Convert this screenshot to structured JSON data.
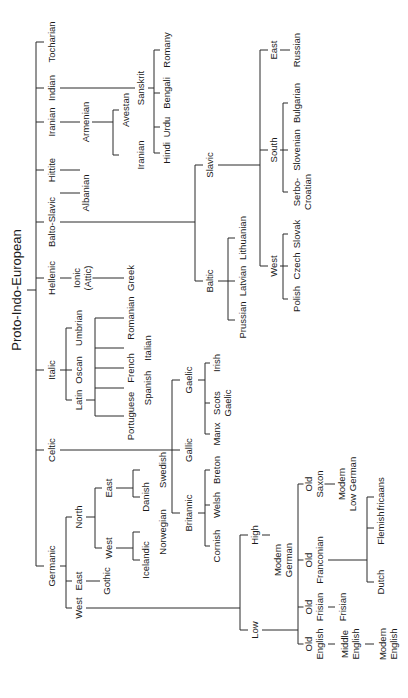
{
  "nodes": {
    "tocharian": "Tocharian",
    "indian": "Indian",
    "iranian": "Iranian",
    "hittite": "Hittite",
    "balto_slavic": "Balto-Slavic",
    "hellenic": "Hellenic",
    "italic": "Italic",
    "celtic": "Celtic",
    "germanic": "Germanic",
    "sanskrit": "Sanskrit",
    "romany": "Romany",
    "bengali": "Bengali",
    "urdu": "Urdu",
    "hindi": "Hindi",
    "avestan": "Avestan",
    "iranian_lang": "Iranian",
    "armenian": "Armenian",
    "albanian": "Albanian",
    "slavic": "Slavic",
    "baltic": "Baltic",
    "east_slavic": "East",
    "russian": "Russian",
    "south_slavic": "South",
    "bulgarian": "Bulgarian",
    "slovenian": "Slovenian",
    "serbo_croatian": "Serbo-\nCroatian",
    "west_slavic": "West",
    "slovak": "Slovak",
    "czech": "Czech",
    "polish": "Polish",
    "lithuanian": "Lithuanian",
    "latvian": "Latvian",
    "prussian": "Prussian",
    "ionic": "Ionic\n(Attic)",
    "greek": "Greek",
    "umbrian": "Umbrian",
    "oscan": "Oscan",
    "latin": "Latin",
    "romanian": "Romanian",
    "italian": "Italian",
    "french": "French",
    "spanish": "Spanish",
    "portuguese": "Portuguese",
    "gaelic": "Gaelic",
    "gallic": "Gallic",
    "britannic": "Britannic",
    "irish": "Irish",
    "scots_gaelic": "Scots\nGaelic",
    "manx": "Manx",
    "breton": "Breton",
    "welsh": "Welsh",
    "cornish": "Cornish",
    "north_germanic": "North",
    "east_germanic": "East",
    "west_germanic": "West",
    "east_north": "East",
    "west_north": "West",
    "swedish": "Swedish",
    "danish": "Danish",
    "norwegian": "Norwegian",
    "icelandic": "Icelandic",
    "gothic": "Gothic",
    "high": "High",
    "low": "Low",
    "modern_german": "Modern\nGerman",
    "old_saxon": "Old\nSaxon",
    "modern_low_german": "Modern\nLow German",
    "old_franconian": "Old\nFranconian",
    "africaans": "Africaans",
    "flemish": "Flemish",
    "dutch": "Dutch",
    "old_frisian": "Old\nFrisian",
    "frisian": "Frisian",
    "old_english": "Old\nEnglish",
    "middle_english": "Middle\nEnglish",
    "modern_english": "Modern\nEnglish"
  }
}
